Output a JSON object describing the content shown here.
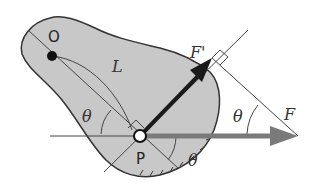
{
  "diagram": {
    "type": "physics-free-body",
    "labels": {
      "pivot": "O",
      "length": "L",
      "point": "P",
      "force": "F",
      "force_component": "F'",
      "angle_left": "θ",
      "angle_bottom": "θ",
      "angle_right": "θ"
    },
    "colors": {
      "body_fill": "#c8c8c8",
      "outline": "#333333",
      "force_arrow": "#7a7a7a",
      "component_arrow": "#1a1a1a",
      "thin_line": "#444444",
      "background": "#ffffff"
    }
  }
}
